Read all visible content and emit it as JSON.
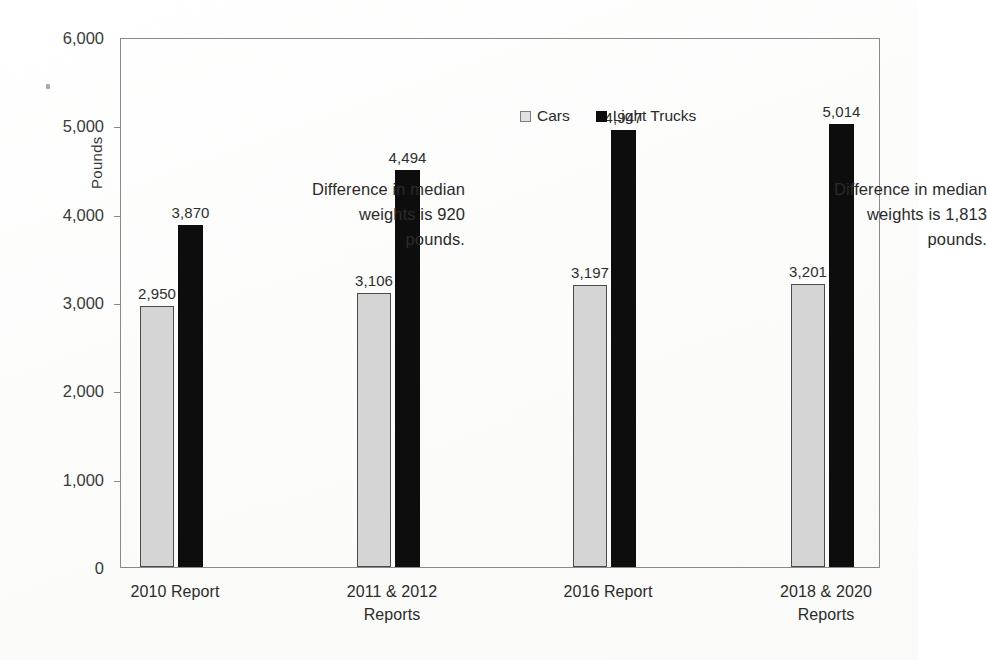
{
  "chart_data": {
    "type": "bar",
    "title": "",
    "xlabel": "",
    "ylabel": "Pounds",
    "ylim": [
      0,
      6000
    ],
    "yticks": [
      "0",
      "1,000",
      "2,000",
      "3,000",
      "4,000",
      "5,000",
      "6,000"
    ],
    "ytick_values": [
      0,
      1000,
      2000,
      3000,
      4000,
      5000,
      6000
    ],
    "grid": false,
    "legend_position": "top-center",
    "categories": [
      "2010 Report",
      "2011 & 2012\nReports",
      "2016 Report",
      "2018 & 2020\nReports"
    ],
    "series": [
      {
        "name": "Cars",
        "color": "#d5d5d5",
        "values": [
          2950,
          3106,
          3197,
          3201
        ],
        "labels": [
          "2,950",
          "3,106",
          "3,197",
          "3,201"
        ]
      },
      {
        "name": "Light Trucks",
        "color": "#0d0d0d",
        "values": [
          3870,
          4494,
          4947,
          5014
        ],
        "labels": [
          "3,870",
          "4,494",
          "4,947",
          "5,014"
        ]
      }
    ],
    "annotations": [
      "Difference in median\nweights is 920\npounds.",
      "Difference in median\nweights is 1,813\npounds."
    ]
  },
  "legend": {
    "items": [
      {
        "label": "Cars",
        "swatch": "cars-swatch-icon"
      },
      {
        "label": "Light Trucks",
        "swatch": "light-trucks-swatch-icon"
      }
    ]
  },
  "axes": {
    "y_title": "Pounds"
  }
}
